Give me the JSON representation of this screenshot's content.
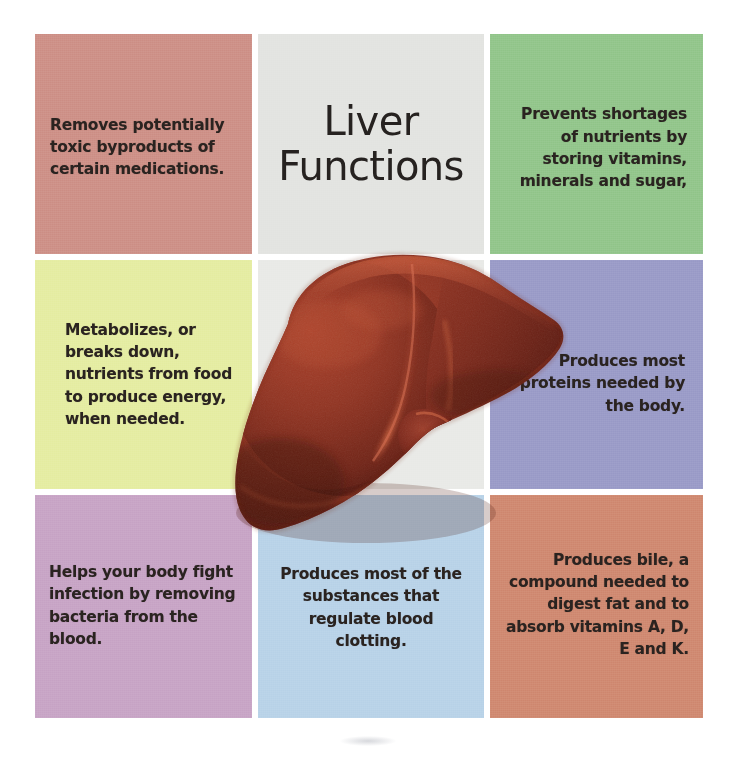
{
  "figure": {
    "title": "Liver Functions",
    "title_line_1": "Liver",
    "title_line_2": "Functions",
    "illustration_name": "liver-anatomy-illustration",
    "canvas_background": "#ffffff"
  },
  "grid": {
    "rows": 3,
    "columns": 3,
    "cells": [
      {
        "id": "removes-toxins",
        "row": 1,
        "column": 1,
        "text": "Removes potentially toxic byproducts of certain medications.",
        "background": "#ce9188",
        "text_color": "#2a2320",
        "align": "left"
      },
      {
        "id": "title",
        "row": 1,
        "column": 2,
        "text": "Liver Functions",
        "background": "#e3e4e1",
        "text_color": "#262220",
        "align": "center"
      },
      {
        "id": "stores-nutrients",
        "row": 1,
        "column": 3,
        "text": "Prevents shortages of nutrients by storing vitamins, minerals and sugar,",
        "background": "#93c68c",
        "text_color": "#2a2320",
        "align": "right"
      },
      {
        "id": "metabolizes-nutrients",
        "row": 2,
        "column": 1,
        "text": "Metabolizes, or breaks down, nutrients from food to produce energy, when needed.",
        "background": "#e5eda3",
        "text_color": "#2a2320",
        "align": "left"
      },
      {
        "id": "liver-image-cell",
        "row": 2,
        "column": 2,
        "text": "",
        "background": "#e9eae7",
        "text_color": "#262220",
        "align": "center"
      },
      {
        "id": "produces-proteins",
        "row": 2,
        "column": 3,
        "text": "Produces most proteins needed by the body.",
        "background": "#9b9cc8",
        "text_color": "#2a2320",
        "align": "right"
      },
      {
        "id": "fights-infection",
        "row": 3,
        "column": 1,
        "text": "Helps your body fight infection by removing bacteria from the blood.",
        "background": "#c8a5c6",
        "text_color": "#2a2320",
        "align": "left"
      },
      {
        "id": "blood-clotting",
        "row": 3,
        "column": 2,
        "text": "Produces most of the substances that regulate blood clotting.",
        "background": "#b9d3e8",
        "text_color": "#2a2320",
        "align": "center"
      },
      {
        "id": "produces-bile",
        "row": 3,
        "column": 3,
        "text": "Produces bile, a compound needed to digest fat and to absorb vitamins A, D, E and K.",
        "background": "#d08a72",
        "text_color": "#2a2320",
        "align": "right"
      }
    ]
  },
  "colors": {
    "rose": "#ce9188",
    "title_gray": "#e3e4e1",
    "green": "#93c68c",
    "pale_yellow": "#e5eda3",
    "periwinkle": "#9b9cc8",
    "mauve": "#c8a5c6",
    "light_blue": "#b9d3e8",
    "terracotta": "#d08a72",
    "liver_base": "#8e3a29",
    "liver_shadow": "#5c2018",
    "liver_highlight": "#b9543b",
    "text_dark": "#2a2320",
    "background": "#ffffff"
  }
}
